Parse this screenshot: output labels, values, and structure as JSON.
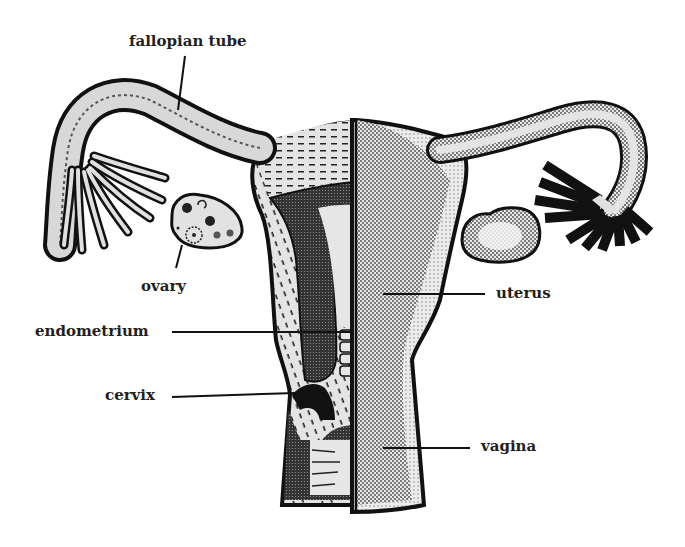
{
  "diagram": {
    "colors": {
      "outline": "#111111",
      "fill_light": "#e6e6e6",
      "fill_mid": "#b5b5b5",
      "fill_dark": "#222222",
      "text": "#231f20"
    },
    "labels": {
      "fallopian_tube": "fallopian tube",
      "ovary": "ovary",
      "endometrium": "endometrium",
      "cervix": "cervix",
      "uterus": "uterus",
      "vagina": "vagina"
    }
  }
}
